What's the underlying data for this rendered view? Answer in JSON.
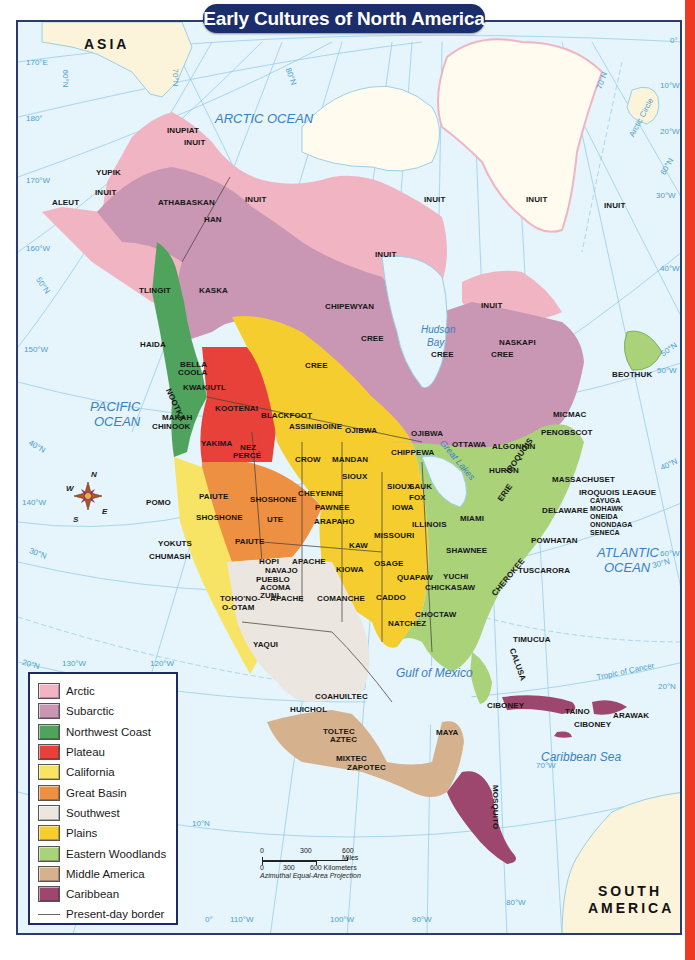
{
  "title": "Early Cultures of North America",
  "colors": {
    "ocean": "#e6f4fb",
    "arctic": "#f0b4c2",
    "subarctic": "#c996b3",
    "northwest_coast": "#4fa35c",
    "plateau": "#e8413a",
    "california": "#f8e464",
    "great_basin": "#ee9042",
    "southwest": "#ebe6df",
    "plains": "#f5cd2e",
    "eastern_woodlands": "#a9d279",
    "middle_america": "#d5b28d",
    "caribbean": "#9d476f",
    "land_other": "#fbf3da",
    "greenland": "#fffbef",
    "title_bg": "#1b2d6b",
    "frame": "#2c3a70",
    "side_strip": "#ee3a22"
  },
  "continents": {
    "asia": "ASIA",
    "south_america_1": "SOUTH",
    "south_america_2": "AMERICA"
  },
  "water_bodies": {
    "arctic_ocean": "ARCTIC OCEAN",
    "pacific_1": "PACIFIC",
    "pacific_2": "OCEAN",
    "atlantic_1": "ATLANTIC",
    "atlantic_2": "OCEAN",
    "hudson_1": "Hudson",
    "hudson_2": "Bay",
    "gulf_of_mexico": "Gulf of Mexico",
    "caribbean_sea": "Caribbean Sea",
    "great_lakes": "Great Lakes"
  },
  "grid_labels": {
    "e170": "170°E",
    "w180": "180°",
    "w170": "170°W",
    "w160": "160°W",
    "w150": "150°W",
    "w140": "140°W",
    "w130": "130°W",
    "w120": "120°W",
    "w110": "110°W",
    "w100": "100°W",
    "w90": "90°W",
    "w80": "80°W",
    "w70": "70°W",
    "w60": "60°W",
    "w50": "50°W",
    "w40": "40°W",
    "w30": "30°W",
    "w20": "20°W",
    "w10": "10°W",
    "zero": "0°",
    "zero_b": "0°",
    "n80": "80°N",
    "n70": "70°N",
    "n70b": "70°N",
    "n60": "60°N",
    "n60b": "60°N",
    "n50": "50°N",
    "n50b": "50°N",
    "n40": "40°N",
    "n40b": "40°N",
    "n30": "30°N",
    "n30b": "30°N",
    "n20": "20°N",
    "n20b": "20°N",
    "n10": "10°N",
    "arctic_circle": "Arctic Circle",
    "tropic_cancer": "Tropic of Cancer"
  },
  "cultures": {
    "inupiat": "INUPIAT",
    "inuit_ak": "INUIT",
    "yupik": "YUPIK",
    "inuit_w": "INUIT",
    "aleut": "ALEUT",
    "athabaskan": "ATHABASKAN",
    "han": "HAN",
    "inuit_n": "INUIT",
    "inuit_arch": "INUIT",
    "inuit_gl1": "INUIT",
    "inuit_gl2": "INUIT",
    "inuit_c": "INUIT",
    "inuit_q": "INUIT",
    "tlingit": "TLINGIT",
    "kaska": "KASKA",
    "chipewyan": "CHIPEWYAN",
    "naskapi": "NASKAPI",
    "haida": "HAIDA",
    "bella_coola_1": "BELLA",
    "bella_coola_2": "COOLA",
    "nootka": "NOOTKA",
    "kwakiutl": "KWAKIUTL",
    "cree_1": "CREE",
    "cree_2": "CREE",
    "cree_3": "CREE",
    "cree_4": "CREE",
    "beothuk": "BEOTHUK",
    "kootenai": "KOOTENAI",
    "blackfoot": "BLACKFOOT",
    "makah": "MAKAH",
    "chinook": "CHINOOK",
    "assiniboine": "ASSINIBOINE",
    "ojibwa_1": "OJIBWA",
    "ojibwa_2": "OJIBWA",
    "micmac": "MICMAC",
    "penobscot": "PENOBSCOT",
    "algonkin": "ALGONKIN",
    "ottawa": "OTTAWA",
    "chippewa": "CHIPPEWA",
    "yakima": "YAKIMA",
    "nez_perce_1": "NEZ",
    "nez_perce_2": "PERCÉ",
    "crow": "CROW",
    "mandan": "MANDAN",
    "huron": "HURON",
    "iroquois": "IROQUOIS",
    "sioux_1": "SIOUX",
    "sioux_2": "SIOUX",
    "sauk": "SAUK",
    "fox": "FOX",
    "massachuset": "MASSACHUSET",
    "iroquois_league": "IROQUOIS LEAGUE",
    "cayuga": "CAYUGA",
    "mohawk": "MOHAWK",
    "oneida": "ONEIDA",
    "onondaga": "ONONDAGA",
    "seneca": "SENECA",
    "pomo": "POMO",
    "paiute_1": "PAIUTE",
    "shoshone_1": "SHOSHONE",
    "cheyenne": "CHEYENNE",
    "shoshone_2": "SHOSHONE",
    "ute": "UTE",
    "pawnee": "PAWNEE",
    "iowa": "IOWA",
    "erie": "ERIE",
    "delaware": "DELAWARE",
    "arapaho": "ARAPAHO",
    "illinois": "ILLINOIS",
    "miami": "MIAMI",
    "missouri": "MISSOURI",
    "yokuts": "YOKUTS",
    "paiute_2": "PAIUTE",
    "kaw": "KAW",
    "shawnee": "SHAWNEE",
    "powhatan": "POWHATAN",
    "chumash": "CHUMASH",
    "hopi": "HOPI",
    "apache_1": "APACHE",
    "navajo": "NAVAJO",
    "osage": "OSAGE",
    "kiowa": "KIOWA",
    "pueblo": "PUEBLO",
    "acoma": "ACOMA",
    "zuni": "ZUNI",
    "tuscarora": "TUSCARORA",
    "cherokee": "CHEROKEE",
    "yuchi": "YUCHI",
    "quapaw": "QUAPAW",
    "tohono_1": "TOHO'NO-",
    "tohono_2": "O-OTAM",
    "apache_2": "APACHE",
    "comanche": "COMANCHE",
    "caddo": "CADDO",
    "chickasaw": "CHICKASAW",
    "choctaw": "CHOCTAW",
    "natchez": "NATCHEZ",
    "yaqui": "YAQUI",
    "timucua": "TIMUCUA",
    "calusa": "CALUSA",
    "coahuiltec": "COAHUILTEC",
    "huichol": "HUICHOL",
    "ciboney_1": "CIBONEY",
    "taino": "TAINO",
    "arawak": "ARAWAK",
    "ciboney_2": "CIBONEY",
    "toltec": "TOLTEC",
    "aztec": "AZTEC",
    "maya": "MAYA",
    "mixtec": "MIXTEC",
    "zapotec": "ZAPOTEC",
    "mosquito": "MOSQUITO"
  },
  "compass": {
    "n": "N",
    "s": "S",
    "e": "E",
    "w": "W"
  },
  "legend": {
    "items": [
      {
        "label": "Arctic",
        "color": "#f0b4c2"
      },
      {
        "label": "Subarctic",
        "color": "#c996b3"
      },
      {
        "label": "Northwest Coast",
        "color": "#4fa35c"
      },
      {
        "label": "Plateau",
        "color": "#e8413a"
      },
      {
        "label": "California",
        "color": "#f8e464"
      },
      {
        "label": "Great Basin",
        "color": "#ee9042"
      },
      {
        "label": "Southwest",
        "color": "#ebe6df"
      },
      {
        "label": "Plains",
        "color": "#f5cd2e"
      },
      {
        "label": "Eastern Woodlands",
        "color": "#a9d279"
      },
      {
        "label": "Middle America",
        "color": "#d5b28d"
      },
      {
        "label": "Caribbean",
        "color": "#9d476f"
      }
    ],
    "border_label": "Present-day border"
  },
  "scale": {
    "miles": [
      "0",
      "300",
      "600 Miles"
    ],
    "km": [
      "0",
      "300",
      "600 Kilometers"
    ],
    "projection": "Azimuthal Equal-Area Projection"
  }
}
